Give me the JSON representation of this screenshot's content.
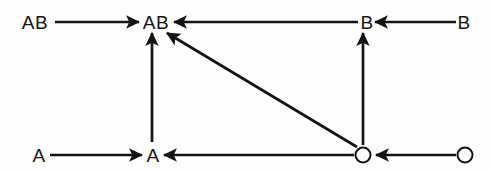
{
  "figure": {
    "kind": "directed-graph-diagram",
    "background_color": "#fdfdfd",
    "stroke_color": "#141414",
    "width": 490,
    "height": 172
  },
  "nodes": [
    {
      "id": "ab-top-left",
      "label": "AB",
      "shape": "text",
      "x": 35,
      "y": 22
    },
    {
      "id": "ab-top-center",
      "label": "AB",
      "shape": "text",
      "x": 156,
      "y": 22
    },
    {
      "id": "b-top-center",
      "label": "B",
      "shape": "text",
      "x": 367,
      "y": 22
    },
    {
      "id": "b-top-right",
      "label": "B",
      "shape": "text",
      "x": 464,
      "y": 22
    },
    {
      "id": "a-bottom-left",
      "label": "A",
      "shape": "text",
      "x": 39,
      "y": 155
    },
    {
      "id": "a-bottom-center",
      "label": "A",
      "shape": "text",
      "x": 153,
      "y": 155
    },
    {
      "id": "o-bottom-center",
      "label": "O",
      "shape": "circle",
      "x": 363,
      "y": 155,
      "radius": 8
    },
    {
      "id": "o-bottom-right",
      "label": "O",
      "shape": "circle",
      "x": 465,
      "y": 155,
      "radius": 8
    }
  ],
  "edges": [
    {
      "id": "edge-ab-left-to-ab-center",
      "from": "ab-top-left",
      "to": "ab-top-center",
      "direction": "right",
      "x1": 55,
      "y1": 22,
      "x2": 139,
      "y2": 22
    },
    {
      "id": "edge-b-center-to-ab-center",
      "from": "b-top-center",
      "to": "ab-top-center",
      "direction": "left",
      "x1": 358,
      "y1": 22,
      "x2": 174,
      "y2": 22
    },
    {
      "id": "edge-b-right-to-b-center",
      "from": "b-top-right",
      "to": "b-top-center",
      "direction": "left",
      "x1": 456,
      "y1": 22,
      "x2": 375,
      "y2": 22
    },
    {
      "id": "edge-a-left-to-a-center",
      "from": "a-bottom-left",
      "to": "a-bottom-center",
      "direction": "right",
      "x1": 50,
      "y1": 155,
      "x2": 142,
      "y2": 155
    },
    {
      "id": "edge-o-center-to-a-center",
      "from": "o-bottom-center",
      "to": "a-bottom-center",
      "direction": "left",
      "x1": 354,
      "y1": 155,
      "x2": 164,
      "y2": 155
    },
    {
      "id": "edge-o-right-to-o-center",
      "from": "o-bottom-right",
      "to": "o-bottom-center",
      "direction": "left",
      "x1": 456,
      "y1": 155,
      "x2": 376,
      "y2": 155
    },
    {
      "id": "edge-a-center-to-ab-center",
      "from": "a-bottom-center",
      "to": "ab-top-center",
      "direction": "up",
      "x1": 152,
      "y1": 142,
      "x2": 152,
      "y2": 33
    },
    {
      "id": "edge-o-center-to-b-center",
      "from": "o-bottom-center",
      "to": "b-top-center",
      "direction": "up",
      "x1": 363,
      "y1": 145,
      "x2": 363,
      "y2": 33
    },
    {
      "id": "edge-o-center-to-ab-center",
      "from": "o-bottom-center",
      "to": "ab-top-center",
      "direction": "up-left",
      "x1": 357,
      "y1": 147,
      "x2": 167,
      "y2": 33
    }
  ]
}
